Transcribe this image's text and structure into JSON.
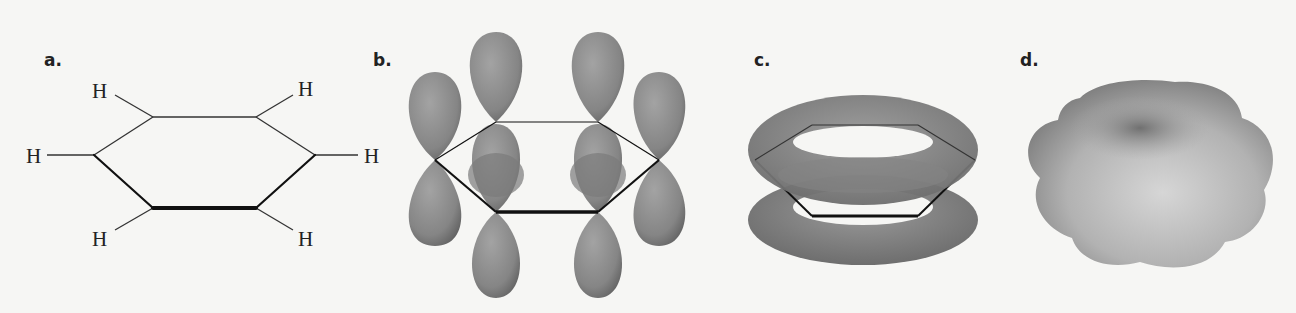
{
  "figure": {
    "panels": [
      {
        "id": "a",
        "label": "a.",
        "description": "benzene Kekule-style hexagon skeleton with hydrogens",
        "atoms": {
          "hydrogen_labels": [
            "H",
            "H",
            "H",
            "H",
            "H",
            "H"
          ]
        }
      },
      {
        "id": "b",
        "label": "b.",
        "description": "six p-orbitals perpendicular to ring plane"
      },
      {
        "id": "c",
        "label": "c.",
        "description": "delocalized pi electron cloud rings above and below ring"
      },
      {
        "id": "d",
        "label": "d.",
        "description": "electron density surface of benzene"
      }
    ],
    "colors": {
      "background": "#f6f6f4",
      "bond": "#222222",
      "orbital": "#8a8a8a",
      "orbital_highlight": "#bdbdbd",
      "orbital_shadow": "#5e5e5e"
    }
  }
}
